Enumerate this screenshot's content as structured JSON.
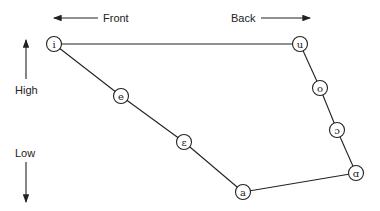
{
  "labels": {
    "front": "Front",
    "back": "Back",
    "high": "High",
    "low": "Low"
  },
  "vowels": {
    "i": {
      "symbol": "i",
      "x": 54,
      "y": 44
    },
    "u": {
      "symbol": "u",
      "x": 300,
      "y": 44
    },
    "e": {
      "symbol": "e",
      "x": 121,
      "y": 96
    },
    "o": {
      "symbol": "o",
      "x": 320,
      "y": 88
    },
    "epsilon": {
      "symbol": "ɛ",
      "x": 184,
      "y": 142
    },
    "open_o": {
      "symbol": "ɔ",
      "x": 337,
      "y": 130
    },
    "a": {
      "symbol": "a",
      "x": 243,
      "y": 192
    },
    "alpha": {
      "symbol": "ɑ",
      "x": 356,
      "y": 173
    }
  },
  "edges": [
    [
      "i",
      "u"
    ],
    [
      "i",
      "e"
    ],
    [
      "e",
      "epsilon"
    ],
    [
      "epsilon",
      "a"
    ],
    [
      "a",
      "alpha"
    ],
    [
      "alpha",
      "open_o"
    ],
    [
      "open_o",
      "o"
    ],
    [
      "o",
      "u"
    ]
  ],
  "colors": {
    "stroke": "#222222",
    "background": "#ffffff"
  }
}
